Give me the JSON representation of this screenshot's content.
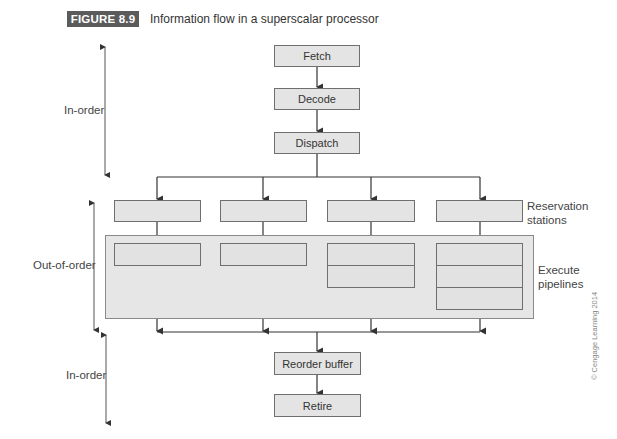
{
  "figure": {
    "label": "FIGURE 8.9",
    "caption": "Information flow in a superscalar processor",
    "label_color": "#5b5b5b"
  },
  "stages": {
    "fetch": "Fetch",
    "decode": "Decode",
    "dispatch": "Dispatch",
    "reorder_buffer": "Reorder buffer",
    "retire": "Retire"
  },
  "groups": {
    "reservation_stations": "Reservation\nstations",
    "reservation_line1": "Reservation",
    "reservation_line2": "stations",
    "execute_line1": "Execute",
    "execute_line2": "pipelines"
  },
  "phases": {
    "top": "In-order",
    "middle": "Out-of-order",
    "bottom": "In-order"
  },
  "pipelines": [
    {
      "stages": 1
    },
    {
      "stages": 1
    },
    {
      "stages": 2
    },
    {
      "stages": 3
    }
  ],
  "credit": "© Cengage Learning 2014"
}
